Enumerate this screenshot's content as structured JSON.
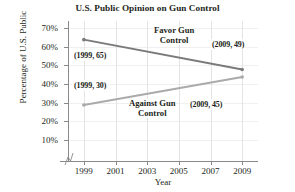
{
  "chart_data": {
    "type": "line",
    "title": "U.S. Public Opinion on Gun Control",
    "xlabel": "Year",
    "ylabel": "Percentage of U.S. Public",
    "x": [
      1999,
      2009
    ],
    "xlim": [
      1998,
      2010
    ],
    "ylim": [
      0,
      75
    ],
    "xticks": [
      "1999",
      "2001",
      "2003",
      "2005",
      "2007",
      "2009"
    ],
    "xtick_values": [
      1999,
      2001,
      2003,
      2005,
      2007,
      2009
    ],
    "yticks": [
      "10%",
      "20%",
      "30%",
      "40%",
      "50%",
      "60%",
      "70%"
    ],
    "ytick_values": [
      10,
      20,
      30,
      40,
      50,
      60,
      70
    ],
    "grid": true,
    "legend": "inline-annotations",
    "series": [
      {
        "name": "Favor Gun Control",
        "color": "#7a7a7a",
        "values": [
          65,
          49
        ],
        "points": [
          {
            "x": 1999,
            "y": 65,
            "label": "(1999, 65)"
          },
          {
            "x": 2009,
            "y": 49,
            "label": "(2009, 49)"
          }
        ]
      },
      {
        "name": "Against Gun Control",
        "color": "#aaaaaa",
        "values": [
          30,
          45
        ],
        "points": [
          {
            "x": 1999,
            "y": 30,
            "label": "(1999, 30)"
          },
          {
            "x": 2009,
            "y": 45,
            "label": "(2009, 45)"
          }
        ]
      }
    ],
    "annotations": [
      {
        "text": "Favor Gun",
        "text2": "Control",
        "series": "Favor Gun Control"
      },
      {
        "text": "Against Gun",
        "text2": "Control",
        "series": "Against Gun Control"
      }
    ],
    "axis_break": true
  },
  "labels": {
    "favor_line1": "Favor Gun",
    "favor_line2": "Control",
    "against_line1": "Against Gun",
    "against_line2": "Control",
    "p_1999_65": "(1999, 65)",
    "p_1999_30": "(1999, 30)",
    "p_2009_49": "(2009, 49)",
    "p_2009_45": "(2009, 45)"
  },
  "yticks": {
    "t70": "70%",
    "t60": "60%",
    "t50": "50%",
    "t40": "40%",
    "t30": "30%",
    "t20": "20%",
    "t10": "10%"
  },
  "xticks": {
    "t1999": "1999",
    "t2001": "2001",
    "t2003": "2003",
    "t2005": "2005",
    "t2007": "2007",
    "t2009": "2009"
  }
}
